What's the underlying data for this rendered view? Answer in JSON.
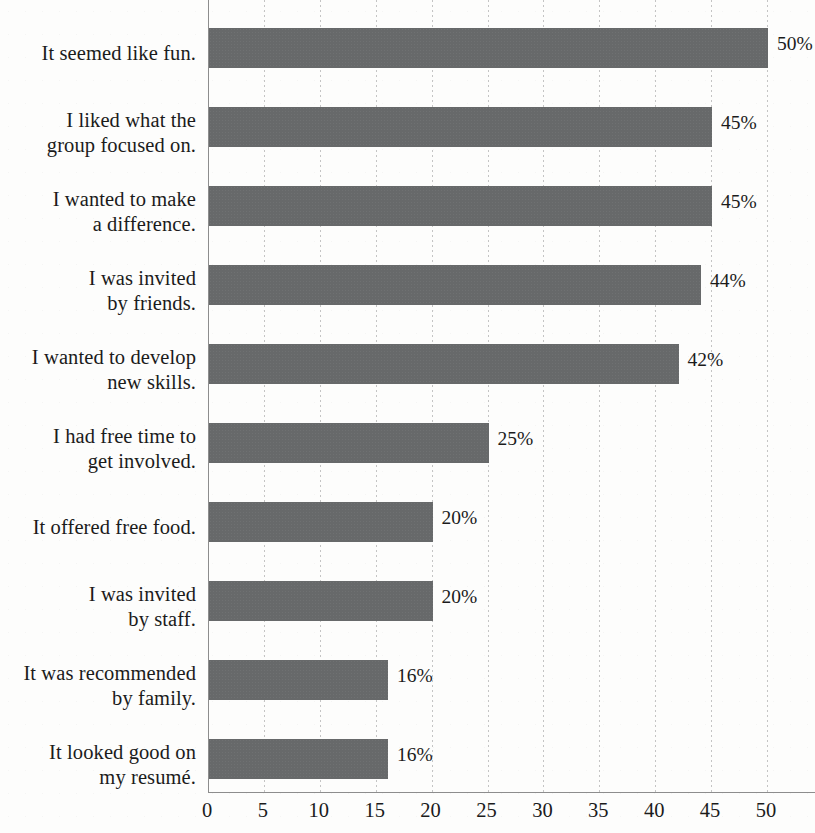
{
  "chart_data": {
    "type": "bar",
    "orientation": "horizontal",
    "title": "",
    "subtitle": "",
    "xlabel": "",
    "ylabel": "",
    "xlim": [
      0,
      50
    ],
    "x_tick_step": 5,
    "grid": "vertical dotted gridlines at each x tick",
    "legend": "none",
    "value_label_suffix": "%",
    "bar_color": "#67696a",
    "categories": [
      "It seemed like fun.",
      "I liked what the\ngroup focused on.",
      "I wanted to make\na difference.",
      "I was invited\nby friends.",
      "I wanted to develop\nnew skills.",
      "I had free time to\nget involved.",
      "It offered free food.",
      "I was invited\nby staff.",
      "It was recommended\nby family.",
      "It looked good on\nmy resumé."
    ],
    "values": [
      50,
      45,
      45,
      44,
      42,
      25,
      20,
      20,
      16,
      16
    ],
    "value_labels": [
      "50%",
      "45%",
      "45%",
      "44%",
      "42%",
      "25%",
      "20%",
      "20%",
      "16%",
      "16%"
    ],
    "x_tick_labels": [
      "0",
      "5",
      "10",
      "15",
      "20",
      "25",
      "30",
      "35",
      "40",
      "45",
      "50"
    ],
    "x_tick_values": [
      0,
      5,
      10,
      15,
      20,
      25,
      30,
      35,
      40,
      45,
      50
    ]
  }
}
